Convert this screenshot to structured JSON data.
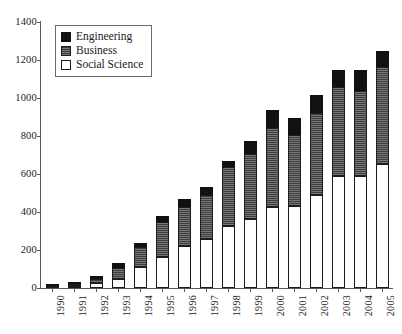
{
  "chart_data": {
    "type": "bar",
    "subtype": "stacked-bar",
    "title": "",
    "subtitle": "",
    "xlabel": "",
    "ylabel": "",
    "ylim": [
      0,
      1400
    ],
    "ytick_step": 200,
    "yticks": [
      0,
      200,
      400,
      600,
      800,
      1000,
      1200,
      1400
    ],
    "ytick_labels": [
      "0",
      "200",
      "400",
      "600",
      "800",
      "1000",
      "1200",
      "1400"
    ],
    "grid": false,
    "legend_position": "top-left",
    "categories": [
      "1990",
      "1991",
      "1992",
      "1993",
      "1994",
      "1995",
      "1996",
      "1997",
      "1998",
      "1999",
      "2000",
      "2001",
      "2002",
      "2003",
      "2004",
      "2005"
    ],
    "series": [
      {
        "name": "Social Science",
        "color": "#ffffff",
        "values": [
          0,
          5,
          25,
          50,
          110,
          165,
          220,
          260,
          325,
          365,
          425,
          430,
          490,
          590,
          590,
          655
        ]
      },
      {
        "name": "Business",
        "color": "#3d3d3d",
        "values": [
          2,
          8,
          25,
          55,
          105,
          180,
          205,
          230,
          310,
          340,
          415,
          375,
          430,
          470,
          445,
          510
        ]
      },
      {
        "name": "Engineering",
        "color": "#111111",
        "values": [
          1,
          5,
          15,
          25,
          20,
          35,
          45,
          40,
          35,
          70,
          95,
          90,
          95,
          90,
          115,
          85
        ]
      }
    ],
    "totals": [
      3,
      18,
      65,
      130,
      235,
      380,
      470,
      530,
      670,
      775,
      935,
      895,
      1015,
      1150,
      1150,
      1250
    ]
  },
  "legend": {
    "items": [
      {
        "label": "Engineering",
        "swatch": "engineering-swatch"
      },
      {
        "label": "Business",
        "swatch": "business-swatch"
      },
      {
        "label": "Social Science",
        "swatch": "social-science-swatch"
      }
    ]
  },
  "colors": {
    "engineering": "#111111",
    "business": "#3d3d3d",
    "social_science": "#ffffff",
    "axis": "#595959",
    "text": "#1a1a1a",
    "background": "#ffffff"
  }
}
